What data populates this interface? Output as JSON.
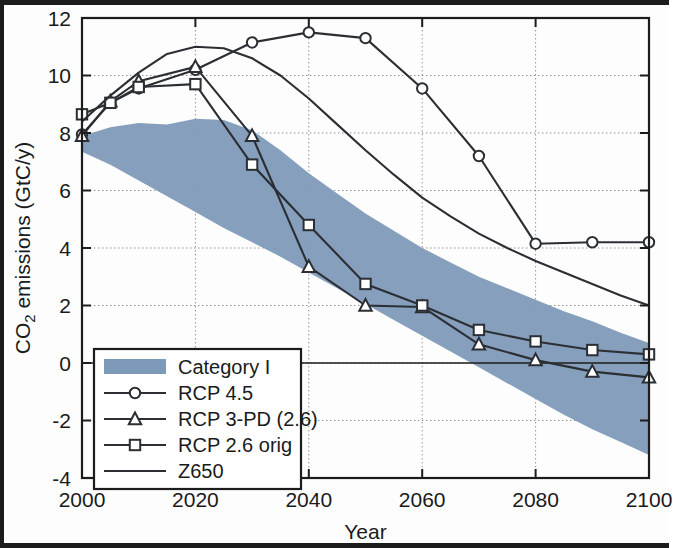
{
  "chart_data": {
    "type": "line",
    "title": "",
    "xlabel": "Year",
    "ylabel": "CO2 emissions (GtC/y)",
    "ylabel_parts": {
      "pre": "CO",
      "sub": "2",
      "post": " emissions (GtC/y)"
    },
    "xlim": [
      2000,
      2100
    ],
    "ylim": [
      -4,
      12
    ],
    "xticks": [
      2000,
      2020,
      2040,
      2060,
      2080,
      2100
    ],
    "xtick_labels": [
      "2000",
      "2020",
      "2040",
      "2060",
      "2080",
      "2100"
    ],
    "yticks": [
      -4,
      -2,
      0,
      2,
      4,
      6,
      8,
      10,
      12
    ],
    "ytick_labels": [
      "-4",
      "-2",
      "0",
      "2",
      "4",
      "6",
      "8",
      "10",
      "12"
    ],
    "grid": "dotted-both",
    "legend_position": "lower-left",
    "band": {
      "name": "Category I",
      "color": "#7e9ab9",
      "x": [
        2000,
        2005,
        2010,
        2015,
        2020,
        2025,
        2030,
        2035,
        2040,
        2045,
        2050,
        2055,
        2060,
        2065,
        2070,
        2075,
        2080,
        2085,
        2090,
        2095,
        2100
      ],
      "upper": [
        7.9,
        8.2,
        8.35,
        8.3,
        8.5,
        8.45,
        8.1,
        7.4,
        6.6,
        5.9,
        5.2,
        4.6,
        4.0,
        3.5,
        3.0,
        2.6,
        2.2,
        1.8,
        1.45,
        1.05,
        0.7
      ],
      "lower": [
        7.35,
        6.9,
        6.35,
        5.8,
        5.25,
        4.7,
        4.2,
        3.7,
        3.15,
        2.6,
        2.05,
        1.5,
        0.95,
        0.4,
        -0.15,
        -0.7,
        -1.25,
        -1.8,
        -2.3,
        -2.75,
        -3.2
      ]
    },
    "series": [
      {
        "name": "RCP 4.5",
        "marker": "circle",
        "color": "#2b2f34",
        "x": [
          2000,
          2005,
          2010,
          2020,
          2030,
          2040,
          2050,
          2060,
          2070,
          2080,
          2090,
          2100
        ],
        "values": [
          7.95,
          9.05,
          9.55,
          10.2,
          11.15,
          11.5,
          11.3,
          9.55,
          7.2,
          4.15,
          4.2,
          4.2
        ]
      },
      {
        "name": "RCP 3-PD (2.6)",
        "marker": "triangle",
        "color": "#2b2f34",
        "x": [
          2000,
          2005,
          2010,
          2020,
          2030,
          2040,
          2050,
          2060,
          2070,
          2080,
          2090,
          2100
        ],
        "values": [
          7.9,
          9.1,
          9.8,
          10.3,
          7.9,
          3.35,
          2.0,
          1.95,
          0.65,
          0.1,
          -0.3,
          -0.5
        ]
      },
      {
        "name": "RCP 2.6 orig",
        "marker": "square",
        "color": "#2b2f34",
        "x": [
          2000,
          2005,
          2010,
          2020,
          2030,
          2040,
          2050,
          2060,
          2070,
          2080,
          2090,
          2100
        ],
        "values": [
          8.65,
          9.05,
          9.6,
          9.7,
          6.9,
          4.8,
          2.75,
          2.0,
          1.15,
          0.75,
          0.45,
          0.3
        ]
      },
      {
        "name": "Z650",
        "marker": "none",
        "color": "#f0744f",
        "x": [
          2000,
          2005,
          2010,
          2015,
          2020,
          2025,
          2030,
          2035,
          2040,
          2045,
          2050,
          2055,
          2060,
          2065,
          2070,
          2075,
          2080,
          2085,
          2090,
          2095,
          2100
        ],
        "values": [
          8.4,
          9.3,
          10.1,
          10.75,
          11.0,
          10.95,
          10.6,
          10.0,
          9.2,
          8.3,
          7.4,
          6.55,
          5.75,
          5.1,
          4.5,
          4.0,
          3.55,
          3.15,
          2.75,
          2.35,
          2.0
        ]
      }
    ]
  },
  "legend": {
    "entries": [
      {
        "label": "Category I",
        "kind": "patch",
        "color": "#7e9ab9"
      },
      {
        "label": "RCP 4.5",
        "kind": "line-marker",
        "marker": "circle",
        "color": "#2b2f34"
      },
      {
        "label": "RCP 3-PD (2.6)",
        "kind": "line-marker",
        "marker": "triangle",
        "color": "#2b2f34"
      },
      {
        "label": "RCP 2.6 orig",
        "kind": "line-marker",
        "marker": "square",
        "color": "#2b2f34"
      },
      {
        "label": "Z650",
        "kind": "line",
        "color": "#f0744f"
      }
    ]
  }
}
